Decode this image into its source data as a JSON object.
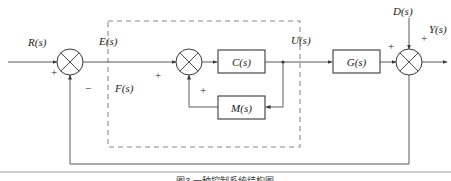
{
  "figure": {
    "caption": "图3 一种控制系统结构图",
    "type": "control-system-block-diagram"
  },
  "signals": {
    "reference": "R(s)",
    "error": "E(s)",
    "inner_input": "F(s)",
    "control": "U(s)",
    "disturbance": "D(s)",
    "output": "Y(s)"
  },
  "blocks": [
    {
      "id": "controller",
      "label": "C(s)"
    },
    {
      "id": "inner-feedback",
      "label": "M(s)"
    },
    {
      "id": "plant",
      "label": "G(s)"
    }
  ],
  "summing_junctions": [
    {
      "id": "outer-error-junction",
      "signs": {
        "left": "+",
        "bottom": "−"
      }
    },
    {
      "id": "inner-junction",
      "signs": {
        "left": "+",
        "bottom": "+"
      }
    },
    {
      "id": "disturbance-junction",
      "signs": {
        "left": "+",
        "top_right": "+"
      }
    }
  ],
  "colors": {
    "wire": "#5a5a5a",
    "block_stroke": "#3a3a3a",
    "dashed_stroke": "#8a8a8a",
    "text": "#1a1a1a",
    "background": "#ffffff"
  }
}
